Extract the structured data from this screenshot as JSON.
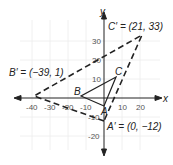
{
  "diagram": {
    "type": "coordinate-plane-dilation",
    "axes": {
      "x_label": "x",
      "y_label": "y",
      "x_ticks": [
        "-40",
        "-30",
        "-20",
        "-10",
        "10",
        "20"
      ],
      "x_tick_values": [
        -40,
        -30,
        -20,
        -10,
        10,
        20
      ],
      "y_ticks": [
        "30",
        "20",
        "10",
        "-10",
        "-20"
      ],
      "y_tick_values": [
        30,
        20,
        10,
        -10,
        -20
      ]
    },
    "original_triangle": {
      "vertices": [
        {
          "name": "A",
          "label": "A",
          "x": 0,
          "y": -4
        },
        {
          "name": "B",
          "label": "B",
          "x": -13,
          "y": 3
        },
        {
          "name": "C",
          "label": "C",
          "x": 7,
          "y": 11
        }
      ],
      "style": "solid"
    },
    "image_triangle": {
      "vertices": [
        {
          "name": "A'",
          "label": "A′ = (0, −12)",
          "x": 0,
          "y": -12
        },
        {
          "name": "B'",
          "label": "B′ = (−39, 1)",
          "x": -39,
          "y": 1
        },
        {
          "name": "C'",
          "label": "C′ = (21, 33)",
          "x": 21,
          "y": 33
        }
      ],
      "style": "dashed"
    },
    "colors": {
      "line": "#222222",
      "grid": "#ececec",
      "text": "#222222"
    }
  }
}
